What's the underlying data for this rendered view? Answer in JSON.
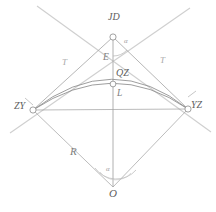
{
  "figure": {
    "kind": "circular-curve-elements-diagram",
    "colors": {
      "tangent_line": "#c9c9c9",
      "chord_line": "#9a9a9a",
      "radius_line": "#a8a8a8",
      "arc_curve": "#8f8f8f",
      "text": "#6b6b6b",
      "background": "#ffffff"
    }
  },
  "points": {
    "jd": {
      "label": "JD",
      "x": 113,
      "y": 37
    },
    "zy": {
      "label": "ZY",
      "x": 33,
      "y": 110
    },
    "yz": {
      "label": "YZ",
      "x": 188,
      "y": 109
    },
    "qz": {
      "label": "QZ",
      "x": 113,
      "y": 84
    },
    "o": {
      "label": "O",
      "x": 113,
      "y": 187
    }
  },
  "dimensions": {
    "tangent_left": "T",
    "tangent_right": "T",
    "external": "E",
    "curve_length": "L",
    "radius": "R",
    "angle_jd": "α",
    "angle_o": "α"
  },
  "labels": {
    "jd": "JD",
    "zy": "ZY",
    "yz": "YZ",
    "qz": "QZ",
    "o": "O",
    "e": "E",
    "l": "L",
    "r": "R",
    "t_left": "T",
    "t_right": "T",
    "alpha_jd": "α",
    "alpha_o": "α"
  }
}
